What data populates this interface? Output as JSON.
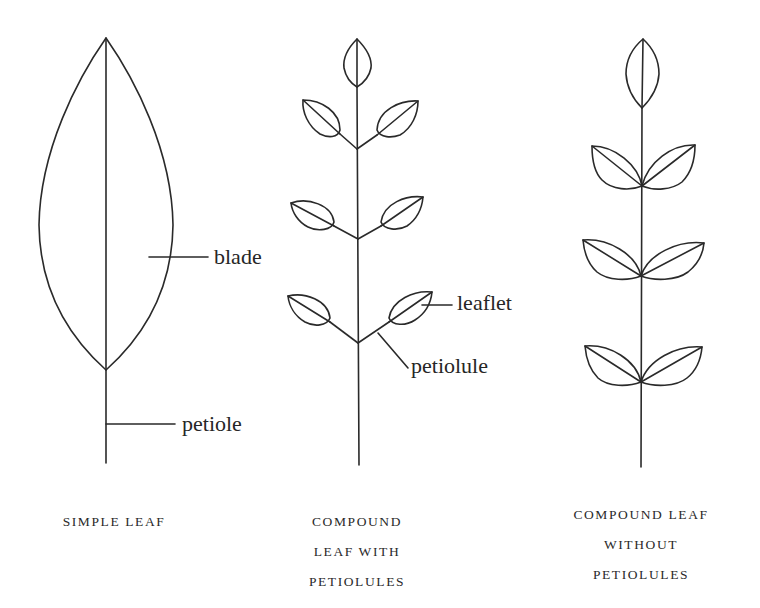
{
  "diagram": {
    "colors": {
      "background": "#ffffff",
      "ink": "#2a2a2a"
    },
    "simple_leaf": {
      "labels": {
        "blade": "blade",
        "petiole": "petiole"
      },
      "caption": [
        "SIMPLE LEAF"
      ]
    },
    "compound_with_petiolules": {
      "labels": {
        "leaflet": "leaflet",
        "petiolule": "petiolule"
      },
      "caption": [
        "COMPOUND",
        "LEAF WITH",
        "PETIOLULES"
      ]
    },
    "compound_without_petiolules": {
      "caption": [
        "COMPOUND LEAF",
        "WITHOUT",
        "PETIOLULES"
      ]
    }
  }
}
